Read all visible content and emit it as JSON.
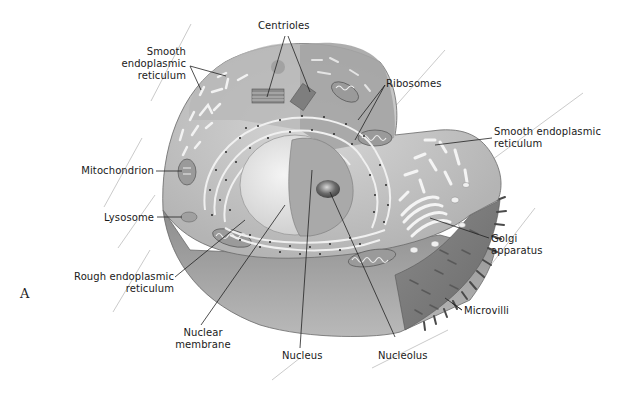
{
  "figure": {
    "panel_letter": "A",
    "colors": {
      "background": "#ffffff",
      "cytoplasm_top": "#bdbdbd",
      "cytoplasm_light": "#d9d9d9",
      "cell_side": "#9a9a9a",
      "microvilli_side": "#7a7a7a",
      "nucleus": "#a8a8a8",
      "nucleolus": "#6e6e6e",
      "leader_line": "#222222",
      "stray_line": "#b5b5b5"
    }
  },
  "labels": {
    "centrioles": "Centrioles",
    "smooth_er_left": [
      "Smooth",
      "endoplasmic",
      "reticulum"
    ],
    "ribosomes": "Ribosomes",
    "smooth_er_right": [
      "Smooth endoplasmic",
      "reticulum"
    ],
    "mitochondrion": "Mitochondrion",
    "lysosome": "Lysosome",
    "rough_er": [
      "Rough endoplasmic",
      "reticulum"
    ],
    "golgi": [
      "Golgi",
      "apparatus"
    ],
    "microvilli": "Microvilli",
    "nuclear_membrane": [
      "Nuclear",
      "membrane"
    ],
    "nucleus": "Nucleus",
    "nucleolus": "Nucleolus"
  }
}
